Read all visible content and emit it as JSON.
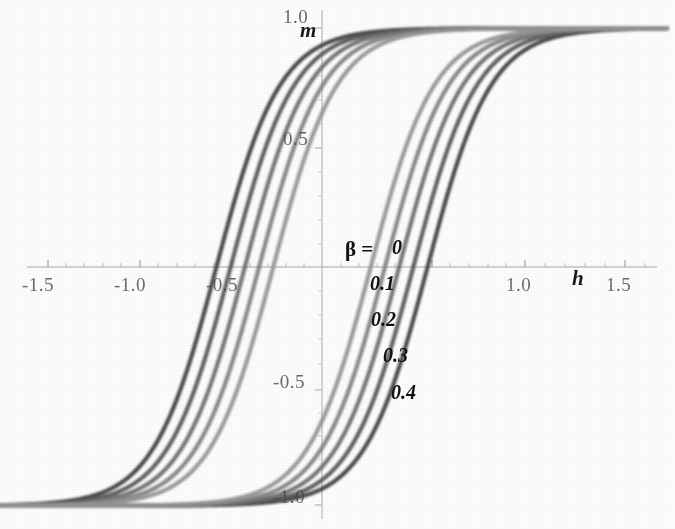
{
  "chart_data": {
    "type": "line",
    "title": "",
    "xlabel": "h",
    "ylabel": "m",
    "xlim": [
      -1.7,
      1.7
    ],
    "ylim": [
      -1.08,
      1.08
    ],
    "grid": false,
    "legend_position": "center",
    "legend_title": "β =",
    "xticks": [
      -1.5,
      -1.0,
      -0.5,
      0.5,
      1.0,
      1.5
    ],
    "xtick_labels": [
      "-1.5",
      "-1.0",
      "-0.5",
      "0.5",
      "1.0",
      "1.5"
    ],
    "yticks": [
      -1.0,
      -0.5,
      0.5,
      1.0
    ],
    "ytick_labels": [
      "-1.0",
      "-0.5",
      "0.5",
      "1.0"
    ],
    "series": [
      {
        "name": "0",
        "beta": 0.0,
        "color": "#3c3c3c",
        "coercive_field": 0.52,
        "saturation": 1.0
      },
      {
        "name": "0.1",
        "beta": 0.1,
        "color": "#555555",
        "coercive_field": 0.45,
        "saturation": 1.0
      },
      {
        "name": "0.2",
        "beta": 0.2,
        "color": "#6b6b6b",
        "coercive_field": 0.38,
        "saturation": 1.0
      },
      {
        "name": "0.3",
        "beta": 0.3,
        "color": "#808080",
        "coercive_field": 0.31,
        "saturation": 1.0
      },
      {
        "name": "0.4",
        "beta": 0.4,
        "color": "#949494",
        "coercive_field": 0.24,
        "saturation": 1.0
      }
    ]
  },
  "axes": {
    "x_label": "h",
    "y_label": "m",
    "x_tick_labels": [
      "-1.5",
      "-1.0",
      "-0.5",
      "1.0",
      "1.5"
    ],
    "y_tick_labels": [
      "1.0",
      "0.5",
      "-0.5",
      "-1.0"
    ],
    "axis_color": "#9a9a9a"
  },
  "legend": {
    "title": "β =",
    "entries": [
      "0",
      "0.1",
      "0.2",
      "0.3",
      "0.4"
    ]
  }
}
